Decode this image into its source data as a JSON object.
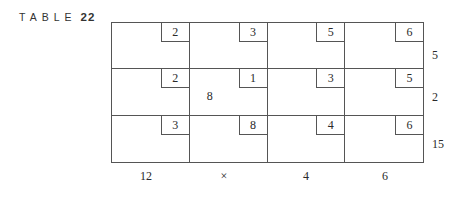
{
  "caption": {
    "label": "TABLE",
    "number": "22"
  },
  "cost_matrix": [
    [
      {
        "cost": "2",
        "allocation": ""
      },
      {
        "cost": "3",
        "allocation": ""
      },
      {
        "cost": "5",
        "allocation": ""
      },
      {
        "cost": "6",
        "allocation": ""
      }
    ],
    [
      {
        "cost": "2",
        "allocation": ""
      },
      {
        "cost": "1",
        "allocation": "8"
      },
      {
        "cost": "3",
        "allocation": ""
      },
      {
        "cost": "5",
        "allocation": ""
      }
    ],
    [
      {
        "cost": "3",
        "allocation": ""
      },
      {
        "cost": "8",
        "allocation": ""
      },
      {
        "cost": "4",
        "allocation": ""
      },
      {
        "cost": "6",
        "allocation": ""
      }
    ]
  ],
  "supply": [
    "5",
    "2",
    "15"
  ],
  "demand": [
    "12",
    "×",
    "4",
    "6"
  ]
}
